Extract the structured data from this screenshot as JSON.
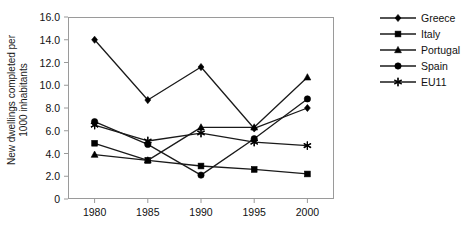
{
  "chart_data": {
    "type": "line",
    "title": "",
    "xlabel": "",
    "ylabel": "New dwellings completed per\n1000 inhabitants",
    "categories": [
      "1980",
      "1985",
      "1990",
      "1995",
      "2000"
    ],
    "x": [
      1980,
      1985,
      1990,
      1995,
      2000
    ],
    "xlim": [
      1977.5,
      2002.5
    ],
    "ylim": [
      0,
      16
    ],
    "yticks": [
      "0",
      "2.0",
      "4.0",
      "6.0",
      "8.0",
      "10.0",
      "12.0",
      "14.0",
      "16.0"
    ],
    "ytick_values": [
      0,
      2,
      4,
      6,
      8,
      10,
      12,
      14,
      16
    ],
    "grid": false,
    "legend_position": "right",
    "series": [
      {
        "name": "Greece",
        "marker": "diamond",
        "values": [
          14.0,
          8.7,
          11.6,
          6.2,
          8.0
        ]
      },
      {
        "name": "Italy",
        "marker": "square",
        "values": [
          4.9,
          3.4,
          2.9,
          2.6,
          2.2
        ]
      },
      {
        "name": "Portugal",
        "marker": "triangle",
        "values": [
          3.9,
          3.4,
          6.3,
          6.3,
          10.7
        ]
      },
      {
        "name": "Spain",
        "marker": "circle",
        "values": [
          6.8,
          4.8,
          2.1,
          5.3,
          8.8
        ]
      },
      {
        "name": "EU11",
        "marker": "asterisk",
        "values": [
          6.5,
          5.1,
          5.8,
          5.0,
          4.7
        ]
      }
    ]
  },
  "legend": {
    "items": [
      {
        "label": "Greece"
      },
      {
        "label": "Italy"
      },
      {
        "label": "Portugal"
      },
      {
        "label": "Spain"
      },
      {
        "label": "EU11"
      }
    ]
  },
  "colors": {
    "line": "#1a1a1a",
    "marker": "#000000",
    "frame": "#9a9a9a",
    "text": "#111111",
    "background": "#ffffff"
  }
}
